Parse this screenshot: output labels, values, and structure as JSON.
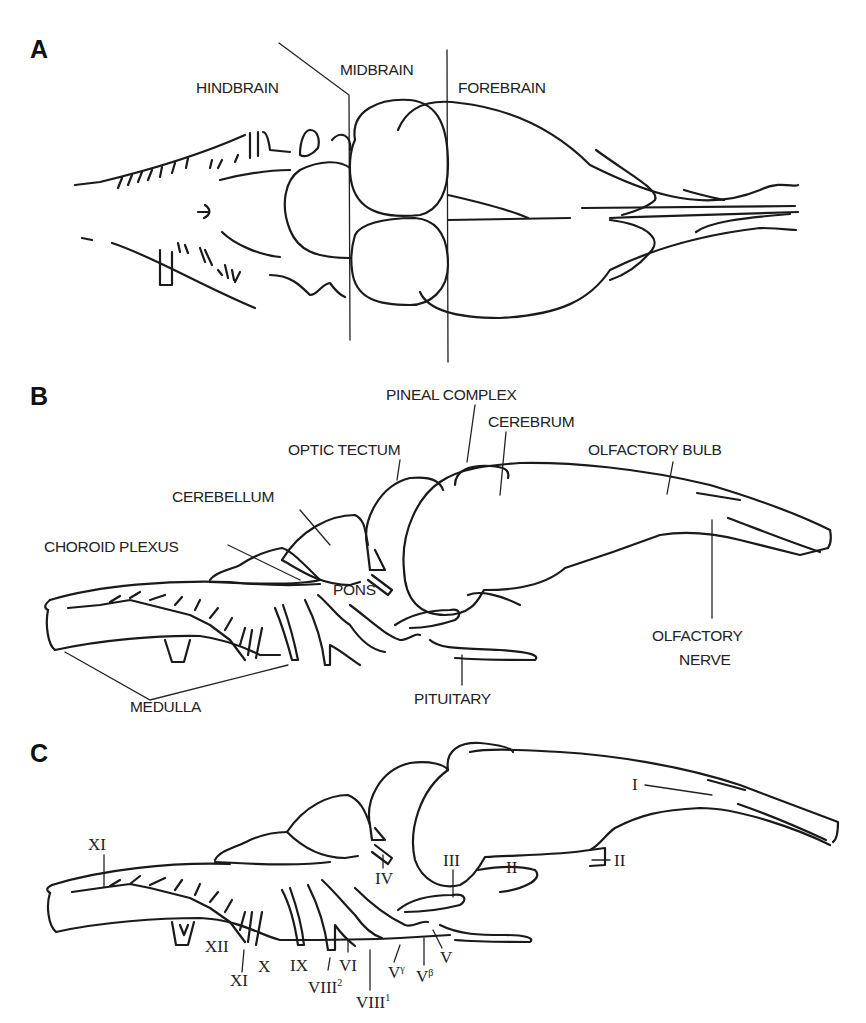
{
  "figure": {
    "panels": [
      {
        "letter": "A",
        "view": "dorsal",
        "labels": {
          "hindbrain": "HINDBRAIN",
          "midbrain": "MIDBRAIN",
          "forebrain": "FOREBRAIN"
        }
      },
      {
        "letter": "B",
        "view": "lateral",
        "labels": {
          "pineal_complex": "PINEAL COMPLEX",
          "cerebrum": "CEREBRUM",
          "optic_tectum": "OPTIC TECTUM",
          "olfactory_bulb": "OLFACTORY BULB",
          "cerebellum": "CEREBELLUM",
          "choroid_plexus": "CHOROID PLEXUS",
          "pons": "PONS",
          "medulla": "MEDULLA",
          "pituitary": "PITUITARY",
          "olfactory_nerve_1": "OLFACTORY",
          "olfactory_nerve_2": "NERVE"
        }
      },
      {
        "letter": "C",
        "view": "lateral-cranial-nerves",
        "labels": {
          "n1": "I",
          "n2_a": "II",
          "n2_b": "II",
          "n3": "III",
          "n4": "IV",
          "n11_top": "XI",
          "n12": "XII",
          "n11_bottom": "XI",
          "n10": "X",
          "n9": "IX",
          "n8_2_base": "VIII",
          "n8_2_sup": "2",
          "n6": "VI",
          "n8_1_base": "VIII",
          "n8_1_sup": "1",
          "n5_gamma_base": "V",
          "n5_gamma_sup": "γ",
          "n5_beta_base": "V",
          "n5_beta_sup": "β",
          "n5": "V"
        }
      }
    ]
  }
}
